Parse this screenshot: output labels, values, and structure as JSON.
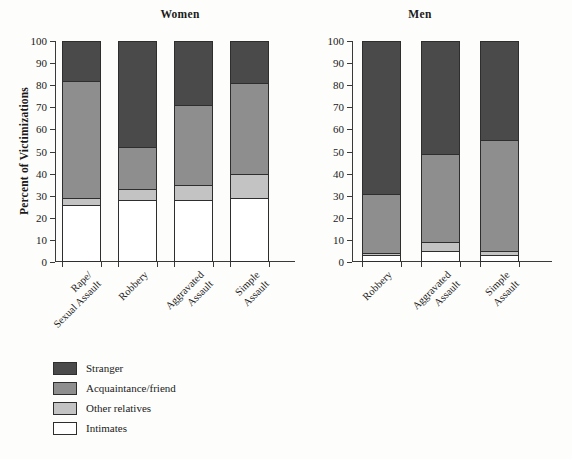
{
  "chart_data": {
    "type": "bar",
    "title": "",
    "subtitle": "",
    "ylabel": "Percent of Victimizations",
    "xlabel": "",
    "ylim": [
      0,
      100
    ],
    "yticks": [
      0,
      10,
      20,
      30,
      40,
      50,
      60,
      70,
      80,
      90,
      100
    ],
    "grid": false,
    "stacked": true,
    "stack_order_bottom_to_top": [
      "Intimates",
      "Other relatives",
      "Acquaintance/friend",
      "Stranger"
    ],
    "legend": {
      "position": "below-left",
      "entries": [
        {
          "label": "Stranger",
          "color": "#4a4a4a"
        },
        {
          "label": "Acquaintance/friend",
          "color": "#8e8e8e"
        },
        {
          "label": "Other relatives",
          "color": "#c3c3c3"
        },
        {
          "label": "Intimates",
          "color": "#ffffff"
        }
      ]
    },
    "panels": [
      {
        "title": "Women",
        "categories": [
          "Rape/\nSexual Assault",
          "Robbery",
          "Aggravated\nAssault",
          "Simple\nAssault"
        ],
        "series": [
          {
            "name": "Intimates",
            "values": [
              26,
              28,
              28,
              29
            ]
          },
          {
            "name": "Other relatives",
            "values": [
              3,
              5,
              7,
              11
            ]
          },
          {
            "name": "Acquaintance/friend",
            "values": [
              53,
              19,
              36,
              41
            ]
          },
          {
            "name": "Stranger",
            "values": [
              18,
              48,
              29,
              19
            ]
          }
        ]
      },
      {
        "title": "Men",
        "categories": [
          "Robbery",
          "Aggravated\nAssault",
          "Simple\nAssault"
        ],
        "series": [
          {
            "name": "Intimates",
            "values": [
              3,
              5,
              3
            ]
          },
          {
            "name": "Other relatives",
            "values": [
              1,
              4,
              2
            ]
          },
          {
            "name": "Acquaintance/friend",
            "values": [
              27,
              40,
              50
            ]
          },
          {
            "name": "Stranger",
            "values": [
              69,
              51,
              45
            ]
          }
        ]
      }
    ]
  }
}
